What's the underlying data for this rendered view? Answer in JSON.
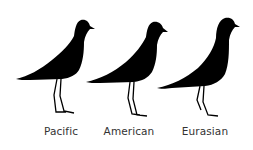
{
  "figure": {
    "background": "#ffffff",
    "silhouette_color": "#000000",
    "label_color": "#333333"
  },
  "birds": [
    {
      "name": "Pacific",
      "label": "Pacific"
    },
    {
      "name": "American",
      "label": "American"
    },
    {
      "name": "Eurasian",
      "label": "Eurasian"
    }
  ]
}
